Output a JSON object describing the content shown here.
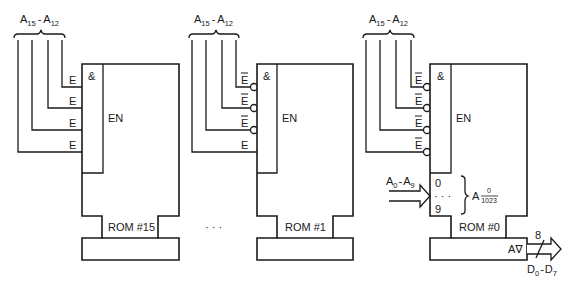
{
  "diagram": {
    "type": "ROM address decoding / chip selection schematic",
    "roms": [
      {
        "name": "ROM #15",
        "address_bus_label": {
          "base": "A",
          "sub_hi": "15",
          "dash": "-",
          "sub_lo": "12"
        },
        "and_symbol": "&",
        "enable_label": "EN",
        "enable_inputs": [
          {
            "label": "E",
            "inverted": false
          },
          {
            "label": "E",
            "inverted": false
          },
          {
            "label": "E",
            "inverted": false
          },
          {
            "label": "E",
            "inverted": false
          }
        ]
      },
      {
        "name": "ROM #1",
        "address_bus_label": {
          "base": "A",
          "sub_hi": "15",
          "dash": "-",
          "sub_lo": "12"
        },
        "and_symbol": "&",
        "enable_label": "EN",
        "enable_inputs": [
          {
            "label": "E",
            "inverted": true
          },
          {
            "label": "E",
            "inverted": true
          },
          {
            "label": "E",
            "inverted": true
          },
          {
            "label": "E",
            "inverted": false
          }
        ]
      },
      {
        "name": "ROM #0",
        "address_bus_label": {
          "base": "A",
          "sub_hi": "15",
          "dash": "-",
          "sub_lo": "12"
        },
        "and_symbol": "&",
        "enable_label": "EN",
        "enable_inputs": [
          {
            "label": "E",
            "inverted": true
          },
          {
            "label": "E",
            "inverted": true
          },
          {
            "label": "E",
            "inverted": true
          },
          {
            "label": "E",
            "inverted": true
          }
        ],
        "address_input": {
          "label": {
            "base1": "A",
            "sub1": "0",
            "dash": "-",
            "base2": "A",
            "sub2": "9"
          },
          "pin_top": "0",
          "pin_dots": "· · ·",
          "pin_bottom": "9",
          "range_label": {
            "base": "A",
            "numerator": "0",
            "denominator": "1023"
          }
        },
        "data_output": {
          "output_symbol": "A∇",
          "bus_width": "8",
          "label": {
            "base1": "D",
            "sub1": "0",
            "dash": "-",
            "base2": "D",
            "sub2": "7"
          }
        }
      }
    ],
    "ellipsis": "· · ·"
  }
}
